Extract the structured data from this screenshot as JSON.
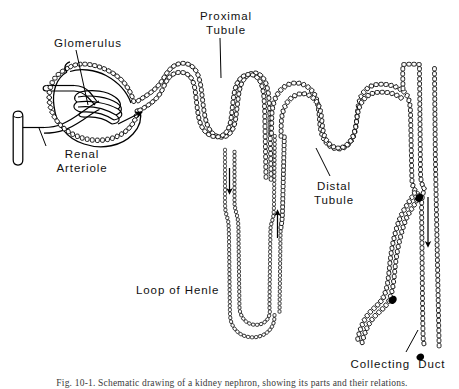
{
  "figure": {
    "title": "Schematic drawing of a kidney nephron",
    "caption": "Fig. 10-1.  Schematic drawing of a kidney nephron, showing its parts and their relations.",
    "background_color": "#ffffff",
    "ink_color": "#000000"
  },
  "labels": {
    "glomerulus": "Glomerulus",
    "renal_arteriole": "Renal\nArteriole",
    "proximal_tubule": "Proximal\nTubule",
    "distal_tubule": "Distal\nTubule",
    "loop_of_henle": "Loop of Henle",
    "collecting_duct": "Collecting  Duct"
  },
  "structures": [
    {
      "name": "renal-arteriole",
      "label": "Renal Arteriole",
      "description": "Vertical blood vessel at far left supplying the afferent arteriole"
    },
    {
      "name": "glomerulus",
      "label": "Glomerulus",
      "description": "Capillary tuft enclosed within Bowman's capsule"
    },
    {
      "name": "bowmans-capsule",
      "label": "",
      "description": "Cup-shaped epithelial capsule surrounding the glomerulus"
    },
    {
      "name": "proximal-tubule",
      "label": "Proximal Tubule",
      "description": "Convoluted tubule with cuboidal epithelial cells leaving Bowman's capsule"
    },
    {
      "name": "loop-of-henle",
      "label": "Loop of Henle",
      "description": "Long hairpin loop with descending and ascending limbs"
    },
    {
      "name": "distal-tubule",
      "label": "Distal Tubule",
      "description": "Convoluted tubule returning toward the collecting duct"
    },
    {
      "name": "collecting-duct",
      "label": "Collecting Duct",
      "description": "Vertical duct at right receiving several nephrons"
    }
  ],
  "flow_arrows": [
    {
      "name": "filtrate-entry-arrow",
      "direction": "right",
      "location": "Bowman's capsule into proximal tubule"
    },
    {
      "name": "descending-limb-arrow",
      "direction": "down",
      "location": "Descending limb of loop of Henle"
    },
    {
      "name": "ascending-limb-arrow",
      "direction": "up",
      "location": "Ascending limb of loop of Henle"
    },
    {
      "name": "collecting-duct-arrow",
      "direction": "down",
      "location": "Collecting duct"
    }
  ]
}
